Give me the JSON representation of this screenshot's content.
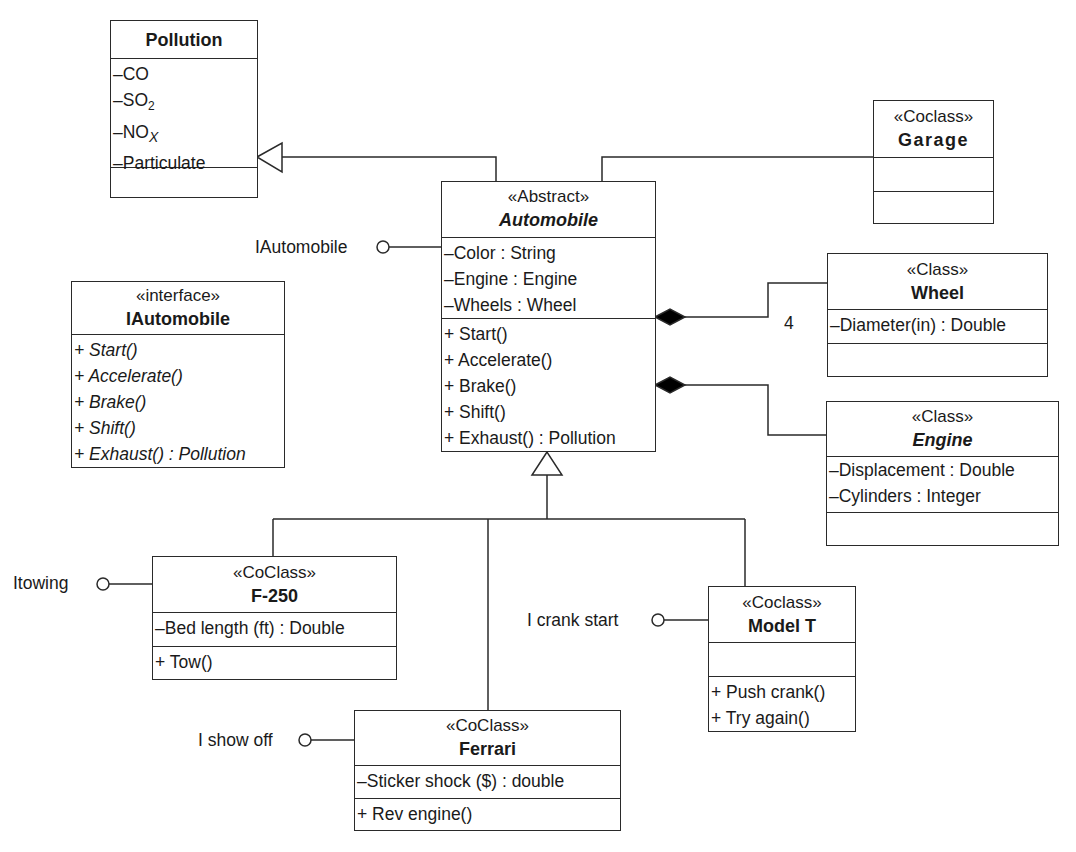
{
  "diagram": {
    "type": "UML class diagram",
    "line_color": "#2a2a2a",
    "classes": {
      "pollution": {
        "stereotype": "",
        "name": "Pollution",
        "attributes": [
          "–CO",
          "–SO",
          "–NO",
          "–Particulate"
        ],
        "attribute_subscripts": [
          "",
          "2",
          "X",
          ""
        ],
        "operations": []
      },
      "garage": {
        "stereotype": "«Coclass»",
        "name": "Garage",
        "attributes": [],
        "operations": []
      },
      "automobile": {
        "stereotype": "«Abstract»",
        "name": "Automobile",
        "attributes": [
          "–Color : String",
          "–Engine : Engine",
          "–Wheels : Wheel"
        ],
        "operations": [
          "+ Start()",
          "+ Accelerate()",
          "+ Brake()",
          "+ Shift()",
          "+ Exhaust() : Pollution"
        ]
      },
      "iautomobile": {
        "stereotype": "«interface»",
        "name": "IAutomobile",
        "operations": [
          "+ Start()",
          "+ Accelerate()",
          "+ Brake()",
          "+ Shift()",
          "+ Exhaust() : Pollution"
        ]
      },
      "wheel": {
        "stereotype": "«Class»",
        "name": "Wheel",
        "attributes": [
          "–Diameter(in) : Double"
        ],
        "operations": []
      },
      "engine": {
        "stereotype": "«Class»",
        "name": "Engine",
        "attributes": [
          "–Displacement : Double",
          "–Cylinders : Integer"
        ],
        "operations": []
      },
      "f250": {
        "stereotype": "«CoClass»",
        "name": "F-250",
        "attributes": [
          "–Bed length (ft) : Double"
        ],
        "operations": [
          "+ Tow()"
        ]
      },
      "modelt": {
        "stereotype": "«Coclass»",
        "name": "Model T",
        "attributes": [],
        "operations": [
          "+ Push crank()",
          "+ Try again()"
        ]
      },
      "ferrari": {
        "stereotype": "«CoClass»",
        "name": "Ferrari",
        "attributes": [
          "–Sticker shock ($) : double"
        ],
        "operations": [
          "+ Rev engine()"
        ]
      }
    },
    "interfaces_lollipop": {
      "iautomobile": "IAutomobile",
      "itowing": "Itowing",
      "icrankstart": "I crank start",
      "ishowoff": "I show off"
    },
    "multiplicity": {
      "wheels": "4"
    },
    "relationships": [
      {
        "from": "Automobile",
        "to": "Pollution",
        "kind": "generalization"
      },
      {
        "from": "Automobile",
        "to": "Garage",
        "kind": "association"
      },
      {
        "from": "Automobile",
        "to": "Wheel",
        "kind": "composition",
        "multiplicity": "4"
      },
      {
        "from": "Automobile",
        "to": "Engine",
        "kind": "composition"
      },
      {
        "from": "F-250",
        "to": "Automobile",
        "kind": "generalization"
      },
      {
        "from": "Ferrari",
        "to": "Automobile",
        "kind": "generalization"
      },
      {
        "from": "Model T",
        "to": "Automobile",
        "kind": "generalization"
      },
      {
        "from": "Automobile",
        "to": "IAutomobile",
        "kind": "realization-lollipop"
      },
      {
        "from": "F-250",
        "to": "Itowing",
        "kind": "realization-lollipop"
      },
      {
        "from": "Model T",
        "to": "I crank start",
        "kind": "realization-lollipop"
      },
      {
        "from": "Ferrari",
        "to": "I show off",
        "kind": "realization-lollipop"
      }
    ]
  }
}
